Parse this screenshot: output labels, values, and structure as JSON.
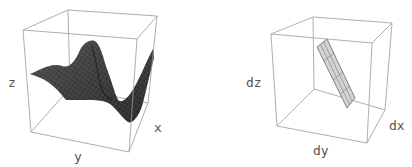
{
  "figures": [
    {
      "name": "surface-plot",
      "axis_labels": {
        "x": "x",
        "y": "y",
        "z": "z"
      },
      "surface_color": "#3c3c3c"
    },
    {
      "name": "tangent-plane-plot",
      "axis_labels": {
        "x": "dx",
        "y": "dy",
        "z": "dz"
      },
      "plane_color": "#d4d4d4"
    }
  ],
  "colors": {
    "box_edge": "#9a9a9a",
    "label": "#555555",
    "background": "#ffffff"
  }
}
